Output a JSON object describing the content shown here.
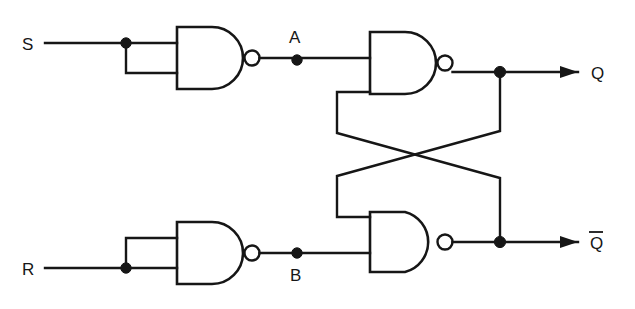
{
  "diagram": {
    "type": "logic-circuit",
    "line_color": "#161616",
    "background_color": "#ffffff",
    "labels": {
      "input_s": "S",
      "input_r": "R",
      "node_a": "A",
      "node_b": "B",
      "output_q": "Q",
      "output_qbar": "Q",
      "output_qbar_overbar": true
    },
    "gates": [
      {
        "id": "gate-s-inverter",
        "type": "NAND",
        "inputs": [
          "S",
          "S"
        ],
        "output": "A"
      },
      {
        "id": "gate-r-inverter",
        "type": "NAND",
        "inputs": [
          "R",
          "R"
        ],
        "output": "B"
      },
      {
        "id": "gate-q",
        "type": "NAND",
        "inputs": [
          "A",
          "Qbar"
        ],
        "output": "Q"
      },
      {
        "id": "gate-qbar",
        "type": "NAND",
        "inputs": [
          "B",
          "Q"
        ],
        "output": "Qbar"
      }
    ],
    "nets": [
      {
        "id": "net-s",
        "from": "S",
        "to": "gate-s-inverter"
      },
      {
        "id": "net-a",
        "from": "gate-s-inverter",
        "to": "gate-q"
      },
      {
        "id": "net-r",
        "from": "R",
        "to": "gate-r-inverter"
      },
      {
        "id": "net-b",
        "from": "gate-r-inverter",
        "to": "gate-qbar"
      },
      {
        "id": "net-q-feedback",
        "from": "Q",
        "to": "gate-qbar"
      },
      {
        "id": "net-qbar-feedback",
        "from": "Qbar",
        "to": "gate-q"
      }
    ],
    "junction_count": 6
  }
}
